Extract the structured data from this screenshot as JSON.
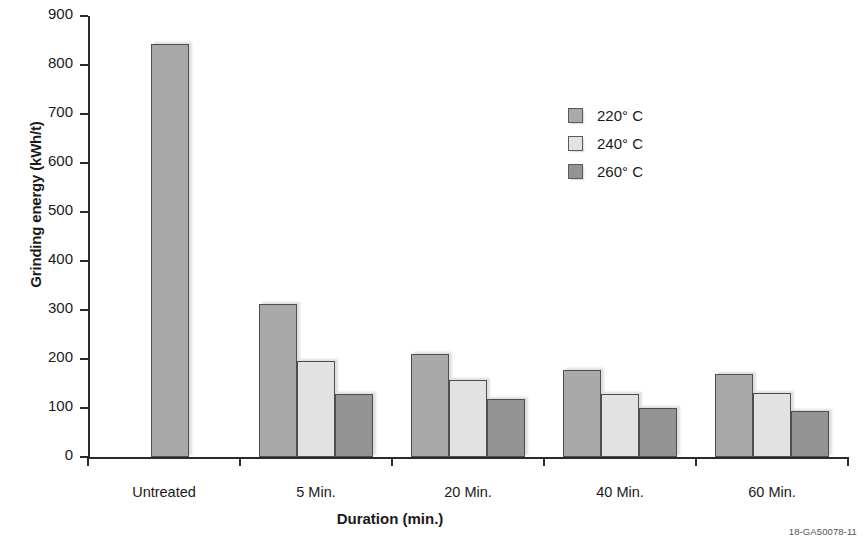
{
  "chart_data": {
    "type": "bar",
    "title": "",
    "xlabel": "Duration (min.)",
    "ylabel": "Grinding energy (kWh/t)",
    "categories": [
      "Untreated",
      "5 Min.",
      "20 Min.",
      "40 Min.",
      "60 Min."
    ],
    "series": [
      {
        "name": "220° C",
        "color": "#a9a9a9",
        "values": [
          843,
          312,
          210,
          177,
          169
        ]
      },
      {
        "name": "240° C",
        "color": "#e2e2e2",
        "values": [
          null,
          196,
          157,
          129,
          130
        ]
      },
      {
        "name": "260° C",
        "color": "#949494",
        "values": [
          null,
          129,
          118,
          101,
          93
        ]
      }
    ],
    "ylim": [
      0,
      900
    ],
    "yticks": [
      0,
      100,
      200,
      300,
      400,
      500,
      600,
      700,
      800,
      900
    ],
    "ytick_labels": [
      "0",
      "100",
      "200",
      "300",
      "400",
      "500",
      "600",
      "700",
      "800",
      "900"
    ],
    "grid": false,
    "legend_position": "upper-right",
    "axis_color": "#2b2b2b",
    "bar_edge_color": "#4e4e4e"
  },
  "legend": {
    "entries": [
      {
        "label": "220° C"
      },
      {
        "label": "240° C"
      },
      {
        "label": "260° C"
      }
    ]
  },
  "footer": {
    "code": "18-GA50078-11"
  }
}
